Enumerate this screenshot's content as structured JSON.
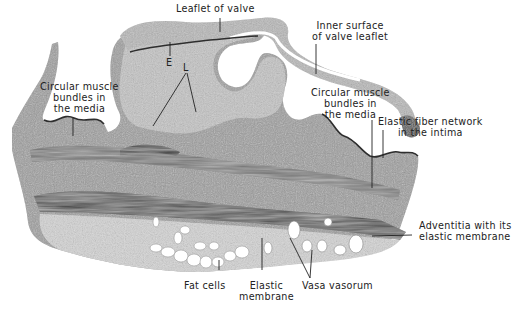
{
  "figure": {
    "labels": {
      "leaflet_of_valve": "Leaflet of valve",
      "inner_surface_line1": "Inner surface",
      "inner_surface_line2": "of valve leaflet",
      "circ_muscle_left_line1": "Circular muscle",
      "circ_muscle_left_line2": "bundles in",
      "circ_muscle_left_line3": "the media",
      "e_marker": "E",
      "l_marker": "L",
      "circ_muscle_right_line1": "Circular muscle",
      "circ_muscle_right_line2": "bundles in",
      "circ_muscle_right_line3": "the media",
      "elastic_fiber_line1": "Elastic fiber network",
      "elastic_fiber_line2": "in the intima",
      "adventitia_line1": "Adventitia with its",
      "adventitia_line2": "elastic membrane",
      "fat_cells": "Fat cells",
      "elastic_membrane_line1": "Elastic",
      "elastic_membrane_line2": "membrane",
      "vasa_vasorum": "Vasa vasorum"
    },
    "colors": {
      "tissue_light": "#c9c9c9",
      "tissue_mid": "#8a8a8a",
      "tissue_dark": "#3a3a3a",
      "background": "#ffffff",
      "text": "#222222"
    }
  }
}
